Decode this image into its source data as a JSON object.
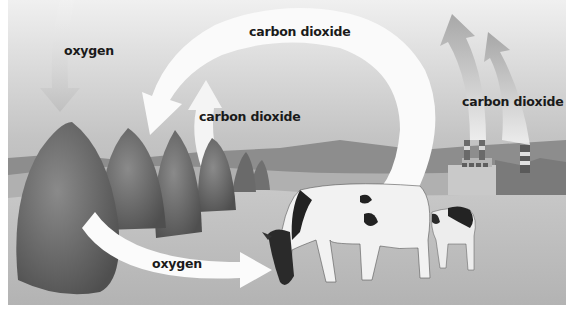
{
  "labels": {
    "oxygen_top": "oxygen",
    "carbon_dioxide_top": "carbon dioxide",
    "carbon_dioxide_middle": "carbon dioxide",
    "carbon_dioxide_factory": "carbon dioxide",
    "oxygen_bottom": "oxygen"
  },
  "scene": {
    "elements": [
      "trees",
      "hills",
      "cow",
      "calf",
      "factory",
      "smokestacks",
      "cycle-arrows"
    ]
  },
  "colors": {
    "sky_top": "#e6e6e6",
    "sky_bottom": "#a9a9a9",
    "ground": "#bdbdbd",
    "trees": "#6f6f6f",
    "arrow": "#ffffff",
    "text": "#1a1a1a"
  }
}
